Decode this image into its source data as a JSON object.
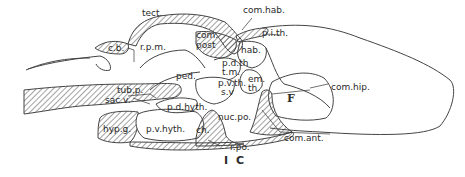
{
  "figure": {
    "label": "I C",
    "type": "sagittal section of brain (anatomical line drawing)",
    "background": "#ffffff",
    "ink": "#2a2a2a"
  },
  "labels": {
    "tect": "tect.",
    "com_hab": "com.hab.",
    "p_i_th": "p.i.th.",
    "c_b": "c.b.",
    "r_p_m": "r.p.m.",
    "com_post_1": "com.",
    "com_post_2": "post",
    "hab": "hab.",
    "p_d_th": "p.d.th",
    "t_m": "t.m.",
    "em_th_1": "em.",
    "em_th_2": "th.",
    "ped": "ped.",
    "p_v_th": "p.v.th.",
    "s_v": "s.v",
    "com_hip": "com.hip.",
    "F": "F",
    "tub_p": "tub.p.",
    "sac_v": "sac.v.",
    "p_d_hyth": "p.d.hyth.",
    "hyp_g": "hyp.g.",
    "p_v_hyth": "p.v.hyth.",
    "ch": "ch.",
    "nuc_po": "nuc.po.",
    "com_ant": "com.ant.",
    "r_po": "r.po."
  }
}
